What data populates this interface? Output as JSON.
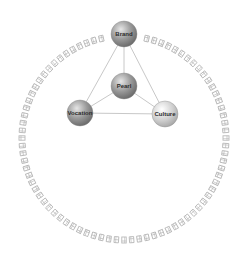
{
  "diagram": {
    "ring": {
      "cx": 124,
      "cy": 138,
      "r": 102,
      "glyph_count": 84,
      "color": "#b8b8b8"
    },
    "nodes": [
      {
        "id": "brand",
        "label": "Brand",
        "cx": 124,
        "cy": 34,
        "r": 13,
        "tone": "dark"
      },
      {
        "id": "pearl",
        "label": "Pearl",
        "cx": 124,
        "cy": 86,
        "r": 13,
        "tone": "dark"
      },
      {
        "id": "vocation",
        "label": "Vocation",
        "cx": 80,
        "cy": 113,
        "r": 13,
        "tone": "dark"
      },
      {
        "id": "culture",
        "label": "Culture",
        "cx": 165,
        "cy": 114,
        "r": 13,
        "tone": "light"
      }
    ],
    "edges": [
      [
        "brand",
        "pearl"
      ],
      [
        "brand",
        "vocation"
      ],
      [
        "brand",
        "culture"
      ],
      [
        "pearl",
        "vocation"
      ],
      [
        "pearl",
        "culture"
      ],
      [
        "vocation",
        "culture"
      ]
    ],
    "edge_color": "#c8c8c8"
  }
}
